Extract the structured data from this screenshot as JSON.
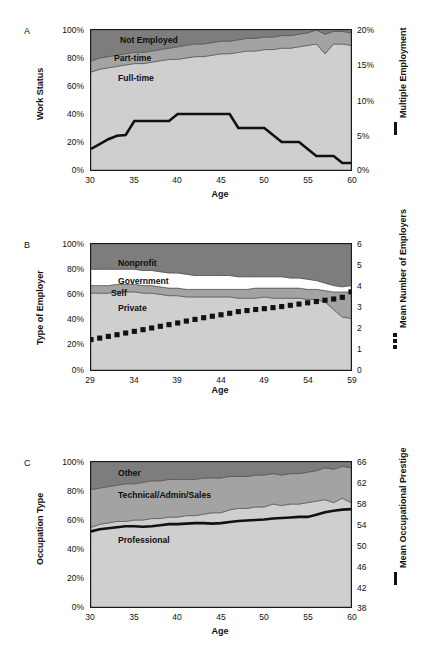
{
  "figure": {
    "background": "#ffffff",
    "palette": {
      "dark_gray": "#7d7d7d",
      "mid_gray": "#a3a3a3",
      "light_gray": "#cfcfcf",
      "white_band": "#ffffff",
      "line_black": "#111111",
      "frame": "#1a1a1a"
    }
  },
  "panels": [
    {
      "letter": "A",
      "left_axis_title": "Work Status",
      "right_axis_title": "Multiple Employment",
      "x_axis_title": "Age",
      "legend_glyph": "line",
      "chart_data": {
        "type": "area",
        "title": "Work Status by Age",
        "xlabel": "Age",
        "ylabel": "Work Status",
        "y2label": "Multiple Employment",
        "xlim": [
          30,
          60
        ],
        "ylim": [
          0,
          100
        ],
        "y2lim": [
          0,
          20
        ],
        "grid": false,
        "legend": "in-plot",
        "xticks": [
          30,
          35,
          40,
          45,
          50,
          55,
          60
        ],
        "xticklabels": [
          "30",
          "35",
          "40",
          "45",
          "50",
          "55",
          "60"
        ],
        "yticks": [
          0,
          20,
          40,
          60,
          80,
          100
        ],
        "yticklabels": [
          "0%",
          "20%",
          "40%",
          "60%",
          "80%",
          "100%"
        ],
        "y2ticks": [
          0,
          5,
          10,
          15,
          20
        ],
        "y2ticklabels": [
          "0%",
          "5%",
          "10%",
          "15%",
          "20%"
        ],
        "x": [
          30,
          31,
          32,
          33,
          34,
          35,
          36,
          37,
          38,
          39,
          40,
          41,
          42,
          43,
          44,
          45,
          46,
          47,
          48,
          49,
          50,
          51,
          52,
          53,
          54,
          55,
          56,
          57,
          58,
          59,
          60
        ],
        "stack_order": [
          "Full-time",
          "Part-time",
          "Not Employed"
        ],
        "series": [
          {
            "name": "Full-time",
            "color": "#cfcfcf",
            "values": [
              70,
              72,
              73,
              74,
              75,
              76,
              76,
              77,
              78,
              79,
              79,
              80,
              81,
              81,
              82,
              83,
              83,
              84,
              85,
              85,
              86,
              86,
              87,
              87,
              88,
              89,
              90,
              83,
              90,
              90,
              89
            ]
          },
          {
            "name": "Part-time",
            "color": "#a3a3a3",
            "values": [
              8,
              8,
              8,
              8,
              8,
              8,
              8,
              8,
              8,
              8,
              9,
              9,
              9,
              9,
              9,
              9,
              9,
              9,
              9,
              9,
              9,
              9,
              9,
              9,
              9,
              9,
              10,
              14,
              9,
              9,
              9
            ]
          },
          {
            "name": "Not Employed",
            "color": "#7d7d7d",
            "values": [
              22,
              20,
              19,
              18,
              17,
              16,
              16,
              15,
              14,
              13,
              12,
              11,
              10,
              10,
              9,
              8,
              8,
              7,
              6,
              6,
              5,
              5,
              4,
              4,
              3,
              2,
              0,
              3,
              1,
              1,
              2
            ]
          }
        ],
        "overlay_line": {
          "name": "Multiple Employment",
          "color": "#111111",
          "axis": "y2",
          "values": [
            3.0,
            3.7,
            4.4,
            4.9,
            5.0,
            7.0,
            7.0,
            7.0,
            7.0,
            7.0,
            8.0,
            8.0,
            8.0,
            8.0,
            8.0,
            8.0,
            8.0,
            6.0,
            6.0,
            6.0,
            6.0,
            5.0,
            4.0,
            4.0,
            4.0,
            3.0,
            2.0,
            2.0,
            2.0,
            1.0,
            1.0
          ]
        },
        "annotations": [
          {
            "text": "Not Employed",
            "x": 33.5,
            "y": 93
          },
          {
            "text": "Part-time",
            "x": 32.5,
            "y": 80
          },
          {
            "text": "Full-time",
            "x": 33.0,
            "y": 67
          }
        ]
      }
    },
    {
      "letter": "B",
      "left_axis_title": "Type of Employer",
      "right_axis_title": "Mean Number of Employers",
      "x_axis_title": "Age",
      "legend_glyph": "squares",
      "chart_data": {
        "type": "area",
        "title": "Type of Employer by Age",
        "xlabel": "Age",
        "ylabel": "Type of Employer",
        "y2label": "Mean Number of Employers",
        "xlim": [
          29,
          59
        ],
        "ylim": [
          0,
          100
        ],
        "y2lim": [
          0,
          6
        ],
        "grid": false,
        "legend": "in-plot",
        "xticks": [
          29,
          34,
          39,
          44,
          49,
          54,
          59
        ],
        "xticklabels": [
          "29",
          "34",
          "39",
          "44",
          "49",
          "54",
          "59"
        ],
        "yticks": [
          0,
          20,
          40,
          60,
          80,
          100
        ],
        "yticklabels": [
          "0%",
          "20%",
          "40%",
          "60%",
          "80%",
          "100%"
        ],
        "y2ticks": [
          0,
          1,
          2,
          3,
          4,
          5,
          6
        ],
        "y2ticklabels": [
          "0",
          "1",
          "2",
          "3",
          "4",
          "5",
          "6"
        ],
        "x": [
          29,
          30,
          31,
          32,
          33,
          34,
          35,
          36,
          37,
          38,
          39,
          40,
          41,
          42,
          43,
          44,
          45,
          46,
          47,
          48,
          49,
          50,
          51,
          52,
          53,
          54,
          55,
          56,
          57,
          58,
          59
        ],
        "stack_order": [
          "Private",
          "Self",
          "Government",
          "Nonprofit"
        ],
        "series": [
          {
            "name": "Private",
            "color": "#cfcfcf",
            "values": [
              61,
              61,
              61,
              62,
              62,
              62,
              61,
              61,
              60,
              59,
              59,
              58,
              58,
              58,
              58,
              58,
              58,
              57,
              57,
              57,
              58,
              57,
              57,
              57,
              57,
              56,
              56,
              54,
              48,
              42,
              41
            ]
          },
          {
            "name": "Self",
            "color": "#a3a3a3",
            "values": [
              6,
              6,
              6,
              6,
              6,
              6,
              6,
              6,
              6,
              6,
              6,
              6,
              6,
              6,
              6,
              6,
              6,
              7,
              7,
              8,
              7,
              8,
              8,
              8,
              8,
              8,
              8,
              9,
              14,
              20,
              21
            ]
          },
          {
            "name": "Government",
            "color": "#ffffff",
            "values": [
              13,
              13,
              13,
              12,
              12,
              12,
              12,
              12,
              12,
              12,
              12,
              12,
              11,
              11,
              11,
              11,
              11,
              10,
              10,
              9,
              9,
              9,
              9,
              8,
              8,
              8,
              7,
              6,
              5,
              4,
              5
            ]
          },
          {
            "name": "Nonprofit",
            "color": "#7d7d7d",
            "values": [
              20,
              20,
              20,
              20,
              20,
              20,
              21,
              21,
              22,
              23,
              23,
              24,
              25,
              25,
              25,
              25,
              25,
              26,
              26,
              26,
              26,
              26,
              26,
              27,
              27,
              28,
              29,
              31,
              33,
              34,
              33
            ]
          }
        ],
        "overlay_markers": {
          "name": "Mean Number of Employers",
          "color": "#111111",
          "axis": "y2",
          "marker": "square",
          "values": [
            1.45,
            1.52,
            1.6,
            1.68,
            1.76,
            1.84,
            1.92,
            2.0,
            2.08,
            2.16,
            2.24,
            2.33,
            2.41,
            2.49,
            2.56,
            2.63,
            2.7,
            2.78,
            2.83,
            2.88,
            2.92,
            2.97,
            3.02,
            3.08,
            3.14,
            3.2,
            3.26,
            3.32,
            3.38,
            3.46,
            3.72
          ]
        },
        "annotations": [
          {
            "text": "Nonprofit",
            "x": 32.0,
            "y": 89
          },
          {
            "text": "Government",
            "x": 32.0,
            "y": 73
          },
          {
            "text": "Self",
            "x": 31.0,
            "y": 63
          },
          {
            "text": "Private",
            "x": 32.0,
            "y": 51
          }
        ]
      }
    },
    {
      "letter": "C",
      "left_axis_title": "Occupation Type",
      "right_axis_title": "Mean Occupational Prestige",
      "x_axis_title": "Age",
      "legend_glyph": "line",
      "chart_data": {
        "type": "area",
        "title": "Occupation Type by Age",
        "xlabel": "Age",
        "ylabel": "Occupation Type",
        "y2label": "Mean Occupational Prestige",
        "xlim": [
          30,
          60
        ],
        "ylim": [
          0,
          100
        ],
        "y2lim": [
          38,
          66
        ],
        "grid": false,
        "legend": "in-plot",
        "xticks": [
          30,
          35,
          40,
          45,
          50,
          55,
          60
        ],
        "xticklabels": [
          "30",
          "35",
          "40",
          "45",
          "50",
          "55",
          "60"
        ],
        "yticks": [
          0,
          20,
          40,
          60,
          80,
          100
        ],
        "yticklabels": [
          "0%",
          "20%",
          "40%",
          "60%",
          "80%",
          "100%"
        ],
        "y2ticks": [
          38,
          42,
          46,
          50,
          54,
          58,
          62,
          66
        ],
        "y2ticklabels": [
          "38",
          "42",
          "46",
          "50",
          "54",
          "58",
          "62",
          "66"
        ],
        "x": [
          30,
          31,
          32,
          33,
          34,
          35,
          36,
          37,
          38,
          39,
          40,
          41,
          42,
          43,
          44,
          45,
          46,
          47,
          48,
          49,
          50,
          51,
          52,
          53,
          54,
          55,
          56,
          57,
          58,
          59,
          60
        ],
        "stack_order": [
          "Professional",
          "Technical/Admin/Sales",
          "Other"
        ],
        "series": [
          {
            "name": "Professional",
            "color": "#cfcfcf",
            "values": [
              55,
              57,
              58,
              59,
              59,
              60,
              60,
              61,
              61,
              62,
              62,
              63,
              63,
              64,
              65,
              65,
              67,
              68,
              68,
              69,
              69,
              71,
              70,
              71,
              71,
              72,
              73,
              74,
              72,
              75,
              72
            ]
          },
          {
            "name": "Technical/Admin/Sales",
            "color": "#a3a3a3",
            "values": [
              26,
              25,
              25,
              25,
              26,
              25,
              26,
              26,
              26,
              26,
              26,
              25,
              25,
              25,
              24,
              24,
              23,
              22,
              22,
              22,
              22,
              21,
              21,
              21,
              21,
              21,
              21,
              22,
              23,
              22,
              24
            ]
          },
          {
            "name": "Other",
            "color": "#7d7d7d",
            "values": [
              19,
              18,
              17,
              16,
              15,
              15,
              14,
              13,
              13,
              12,
              12,
              12,
              12,
              11,
              11,
              11,
              10,
              10,
              10,
              9,
              9,
              8,
              9,
              8,
              8,
              7,
              6,
              4,
              5,
              3,
              4
            ]
          }
        ],
        "overlay_line": {
          "name": "Mean Occupational Prestige",
          "color": "#111111",
          "axis": "y2",
          "values": [
            52.6,
            53.0,
            53.2,
            53.4,
            53.6,
            53.6,
            53.5,
            53.6,
            53.8,
            54.0,
            54.0,
            54.1,
            54.2,
            54.2,
            54.1,
            54.2,
            54.4,
            54.6,
            54.7,
            54.8,
            54.9,
            55.1,
            55.2,
            55.3,
            55.4,
            55.4,
            55.8,
            56.3,
            56.6,
            56.8,
            56.9
          ]
        },
        "annotations": [
          {
            "text": "Other",
            "x": 32.0,
            "y": 90
          },
          {
            "text": "Technical/Admin/Sales",
            "x": 32.0,
            "y": 76
          },
          {
            "text": "Professional",
            "x": 32.0,
            "y": 46
          }
        ]
      }
    }
  ]
}
